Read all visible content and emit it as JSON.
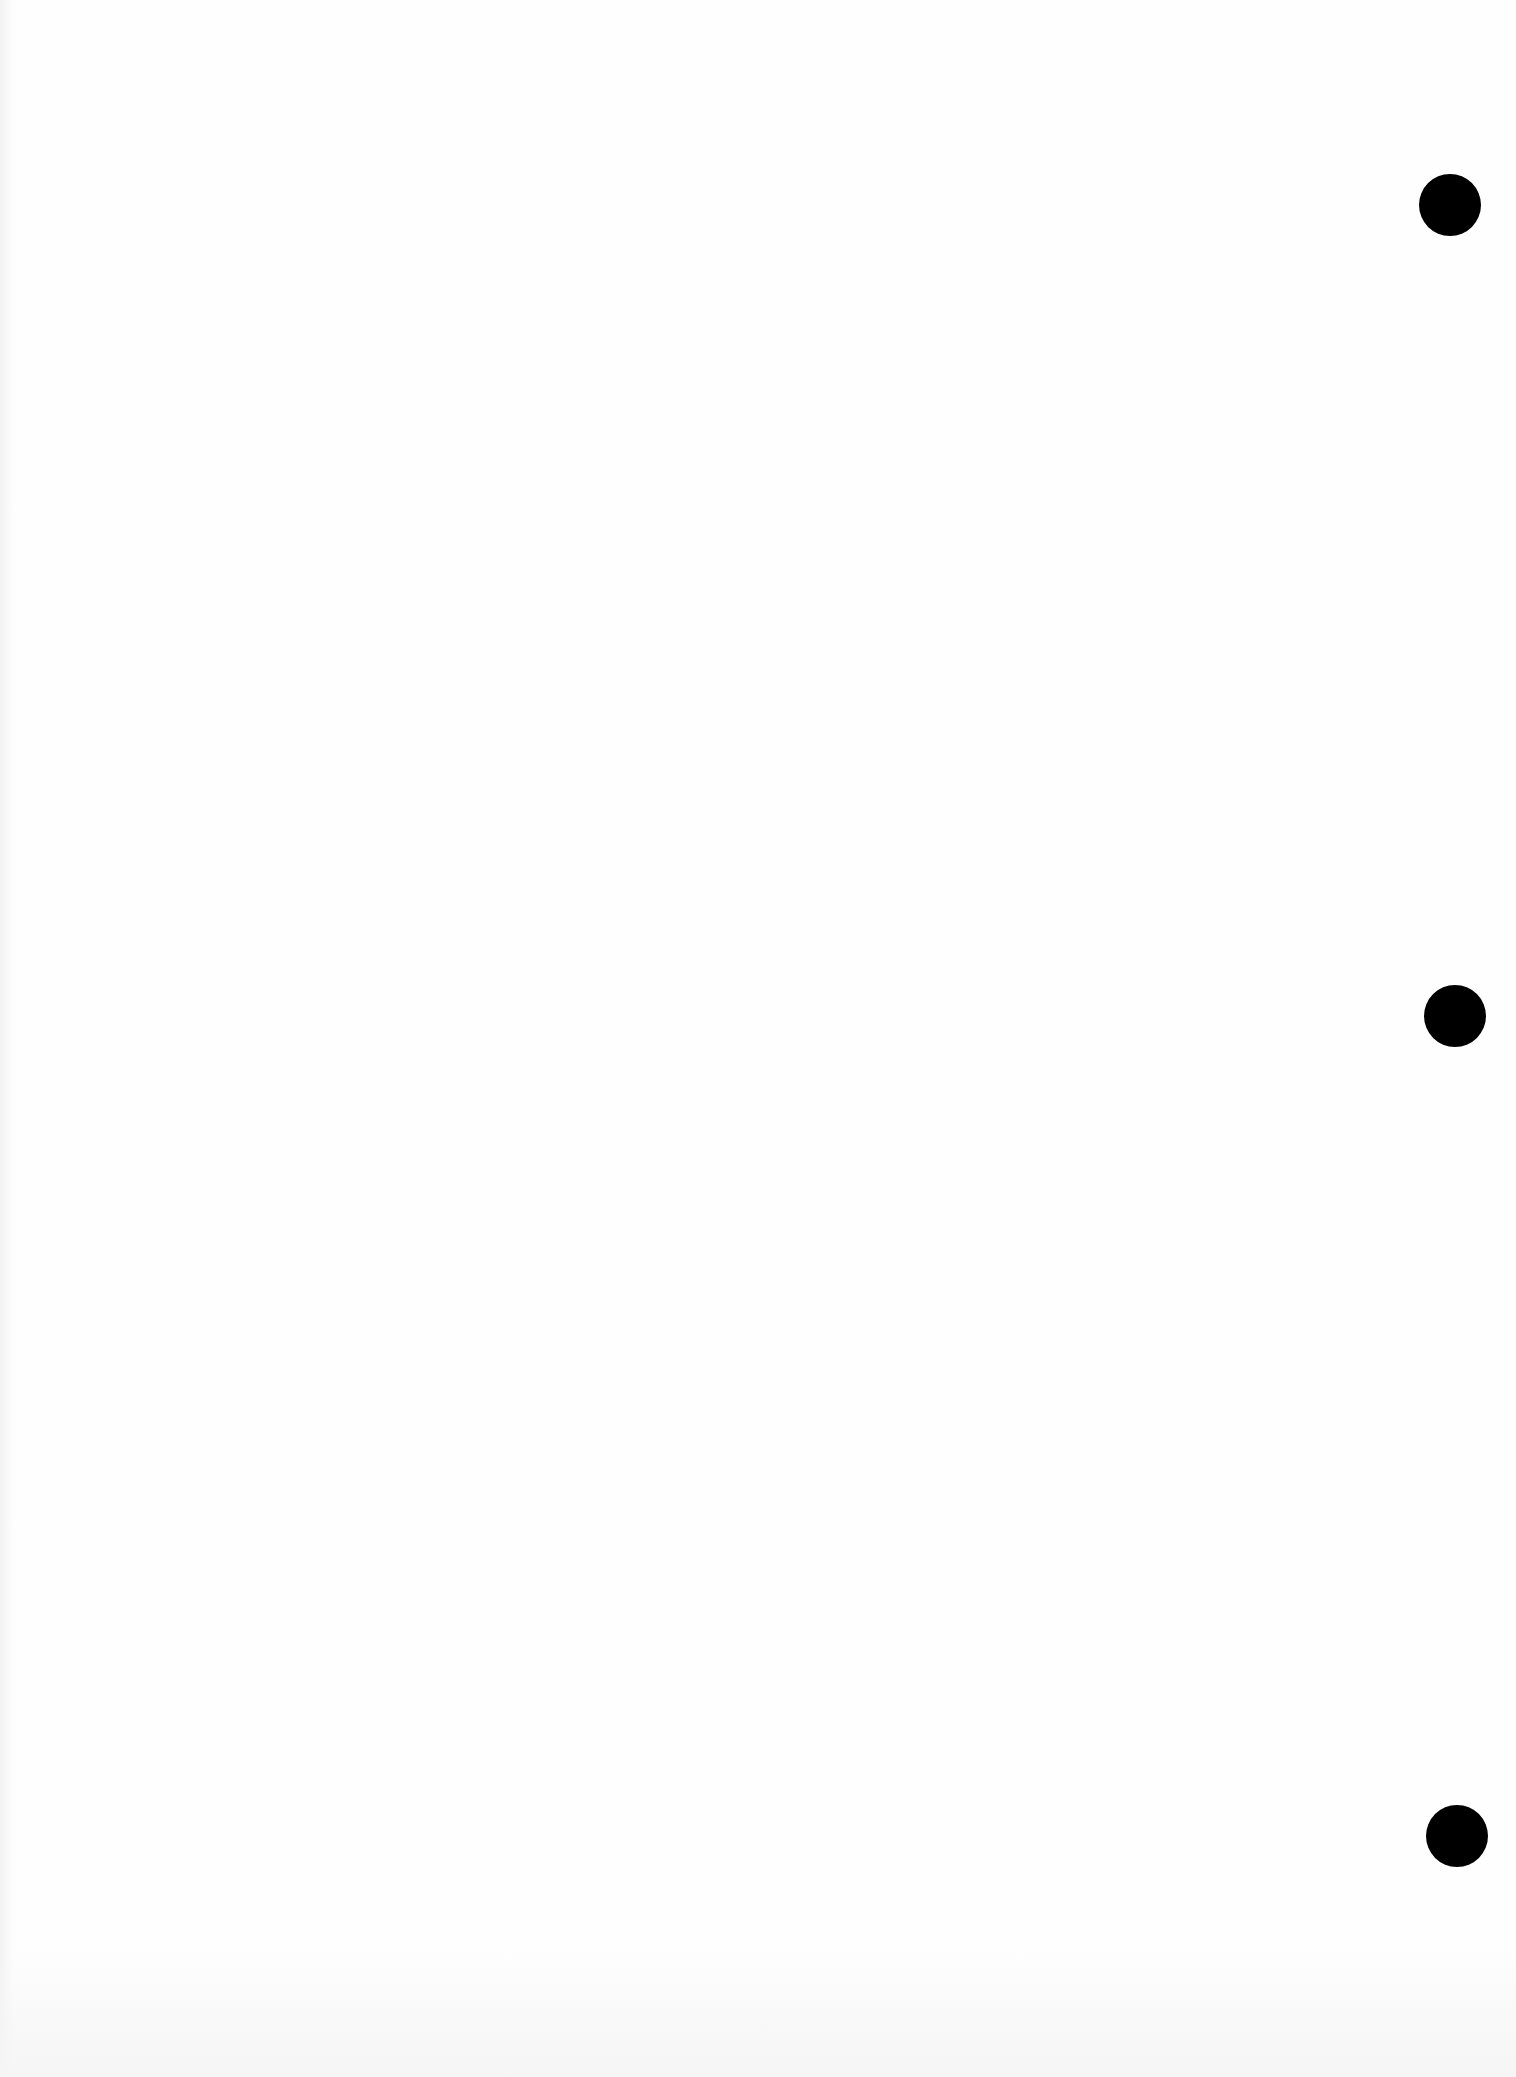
{
  "page": {
    "width": 1516,
    "height": 2077,
    "background_color": "#fefefe",
    "text_content": ""
  },
  "punch_holes": [
    {
      "cx": 1450,
      "cy": 205,
      "diameter": 62,
      "color": "#000000"
    },
    {
      "cx": 1455,
      "cy": 1016,
      "diameter": 62,
      "color": "#000000"
    },
    {
      "cx": 1457,
      "cy": 1836,
      "diameter": 62,
      "color": "#000000"
    }
  ]
}
